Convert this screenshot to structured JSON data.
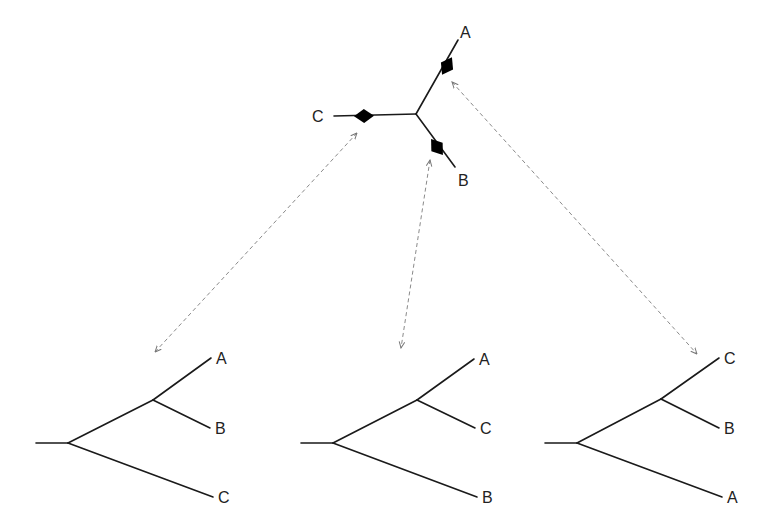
{
  "unrooted_tree": {
    "center": [
      416,
      114
    ],
    "branches": [
      {
        "taxon": "A",
        "end": [
          458,
          40
        ],
        "marker": [
          447,
          66
        ],
        "label_pos": [
          460,
          38
        ]
      },
      {
        "taxon": "B",
        "end": [
          455,
          167
        ],
        "marker": [
          437,
          147
        ],
        "label_pos": [
          458,
          186
        ]
      },
      {
        "taxon": "C",
        "end": [
          334,
          116
        ],
        "marker": [
          364,
          116
        ],
        "label_pos": [
          312,
          122
        ]
      }
    ],
    "labels": {
      "A": "A",
      "B": "B",
      "C": "C"
    }
  },
  "arrows": [
    {
      "from": [
        357,
        133
      ],
      "to": [
        155,
        352
      ],
      "relates_to": "root on branch C"
    },
    {
      "from": [
        430,
        160
      ],
      "to": [
        401,
        348
      ],
      "relates_to": "root on branch B"
    },
    {
      "from": [
        452,
        82
      ],
      "to": [
        697,
        354
      ],
      "relates_to": "root on branch A"
    }
  ],
  "rooted_trees": [
    {
      "stub": [
        [
          36,
          443
        ],
        [
          68,
          443
        ]
      ],
      "inner": [
        153,
        400
      ],
      "tips": [
        {
          "label": "A",
          "pos": [
            211,
            358
          ]
        },
        {
          "label": "B",
          "pos": [
            210,
            428
          ]
        },
        {
          "label": "C",
          "pos": [
            213,
            497
          ]
        }
      ]
    },
    {
      "stub": [
        [
          301,
          443
        ],
        [
          333,
          443
        ]
      ],
      "inner": [
        417,
        400
      ],
      "tips": [
        {
          "label": "A",
          "pos": [
            474,
            359
          ]
        },
        {
          "label": "C",
          "pos": [
            475,
            428
          ]
        },
        {
          "label": "B",
          "pos": [
            477,
            497
          ]
        }
      ]
    },
    {
      "stub": [
        [
          545,
          443
        ],
        [
          577,
          443
        ]
      ],
      "inner": [
        661,
        399
      ],
      "tips": [
        {
          "label": "C",
          "pos": [
            719,
            358
          ]
        },
        {
          "label": "B",
          "pos": [
            719,
            428
          ]
        },
        {
          "label": "A",
          "pos": [
            722,
            497
          ]
        }
      ]
    }
  ],
  "colors": {
    "branch": "#1a1a1a",
    "arrow": "#8a8a8a",
    "marker": "#000000"
  }
}
